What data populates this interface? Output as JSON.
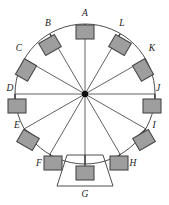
{
  "figure": {
    "type": "technical-diagram",
    "width": 169,
    "height": 205
  },
  "colors": {
    "background": "#ffffff",
    "stroke": "#3a3a3a",
    "block_fill": "#9e9e9e",
    "block_stroke": "#4a4a4a",
    "label": "#1a1a1a",
    "hub": "#111111"
  },
  "geometry": {
    "center_x": 85,
    "center_y": 94,
    "radius": 70,
    "hub_radius": 3
  },
  "circle": {
    "name": "outer-circle",
    "cx": 85,
    "cy": 94,
    "r": 70
  },
  "hub": {
    "name": "center-hub",
    "cx": 85,
    "cy": 94,
    "r": 3.2
  },
  "trapezoid": {
    "name": "base-trapezoid",
    "points": "67,155 103,155 113,186 57,186"
  },
  "nodes": [
    {
      "id": "A",
      "label": "A",
      "angle_deg": 90,
      "rim_x": 85,
      "rim_y": 24,
      "box_x": 76,
      "box_y": 25,
      "box_w": 18,
      "box_h": 14,
      "box_rot": 0,
      "label_x": 85,
      "label_y": 16,
      "stem": "85,24 85,38"
    },
    {
      "id": "B",
      "label": "B",
      "angle_deg": 120,
      "rim_x": 50,
      "rim_y": 34,
      "box_x": 41,
      "box_y": 38,
      "box_w": 18,
      "box_h": 14,
      "box_rot": -30,
      "label_x": 48,
      "label_y": 26,
      "stem": "50,34 57,47"
    },
    {
      "id": "C",
      "label": "C",
      "angle_deg": 150,
      "rim_x": 24,
      "rim_y": 59,
      "box_x": 17,
      "box_y": 63,
      "box_w": 18,
      "box_h": 14,
      "box_rot": -60,
      "label_x": 19,
      "label_y": 51,
      "stem": "24,59 36,66"
    },
    {
      "id": "D",
      "label": "D",
      "angle_deg": 180,
      "rim_x": 15,
      "rim_y": 94,
      "box_x": 8,
      "box_y": 99,
      "box_w": 18,
      "box_h": 14,
      "box_rot": 0,
      "label_x": 10,
      "label_y": 91,
      "stem": "15,94 15,106"
    },
    {
      "id": "E",
      "label": "E",
      "angle_deg": 210,
      "rim_x": 24,
      "rim_y": 129,
      "box_x": 19,
      "box_y": 133,
      "box_w": 18,
      "box_h": 14,
      "box_rot": 30,
      "label_x": 17,
      "label_y": 128,
      "stem": "24,129 34,136"
    },
    {
      "id": "F",
      "label": "F",
      "angle_deg": 240,
      "rim_x": 50,
      "rim_y": 154,
      "box_x": 44,
      "box_y": 156,
      "box_w": 18,
      "box_h": 14,
      "box_rot": 0,
      "label_x": 39,
      "label_y": 166,
      "stem": "50,154 53,163"
    },
    {
      "id": "G",
      "label": "G",
      "angle_deg": 270,
      "rim_x": 85,
      "rim_y": 164,
      "box_x": 76,
      "box_y": 166,
      "box_w": 18,
      "box_h": 14,
      "box_rot": 0,
      "label_x": 85,
      "label_y": 197,
      "stem": "85,155 85,166"
    },
    {
      "id": "H",
      "label": "H",
      "angle_deg": 300,
      "rim_x": 120,
      "rim_y": 154,
      "box_x": 110,
      "box_y": 156,
      "box_w": 18,
      "box_h": 14,
      "box_rot": 0,
      "label_x": 133,
      "label_y": 166,
      "stem": "120,154 117,163"
    },
    {
      "id": "I",
      "label": "I",
      "angle_deg": 330,
      "rim_x": 146,
      "rim_y": 129,
      "box_x": 135,
      "box_y": 133,
      "box_w": 18,
      "box_h": 14,
      "box_rot": -30,
      "label_x": 154,
      "label_y": 128,
      "stem": "146,129 138,136"
    },
    {
      "id": "J",
      "label": "J",
      "angle_deg": 0,
      "rim_x": 155,
      "rim_y": 94,
      "box_x": 143,
      "box_y": 99,
      "box_w": 18,
      "box_h": 14,
      "box_rot": 0,
      "label_x": 158,
      "label_y": 91,
      "stem": "155,94 155,106"
    },
    {
      "id": "K",
      "label": "K",
      "angle_deg": 30,
      "rim_x": 146,
      "rim_y": 59,
      "box_x": 134,
      "box_y": 63,
      "box_w": 18,
      "box_h": 14,
      "box_rot": 60,
      "label_x": 152,
      "label_y": 51,
      "stem": "146,59 136,66"
    },
    {
      "id": "L",
      "label": "L",
      "angle_deg": 60,
      "rim_x": 120,
      "rim_y": 34,
      "box_x": 111,
      "box_y": 38,
      "box_w": 18,
      "box_h": 14,
      "box_rot": 30,
      "label_x": 122,
      "label_y": 26,
      "stem": "120,34 114,47"
    }
  ],
  "spokes": [
    {
      "name": "spoke-A",
      "to": "A",
      "x2": 85,
      "y2": 24
    },
    {
      "name": "spoke-B",
      "to": "B",
      "x2": 50,
      "y2": 34
    },
    {
      "name": "spoke-C",
      "to": "C",
      "x2": 24,
      "y2": 59
    },
    {
      "name": "spoke-D",
      "to": "D",
      "x2": 15,
      "y2": 94
    },
    {
      "name": "spoke-E",
      "to": "E",
      "x2": 24,
      "y2": 129
    },
    {
      "name": "spoke-F",
      "to": "F",
      "x2": 50,
      "y2": 154
    },
    {
      "name": "spoke-G",
      "to": "G",
      "x2": 85,
      "y2": 164
    },
    {
      "name": "spoke-H",
      "to": "H",
      "x2": 120,
      "y2": 154
    },
    {
      "name": "spoke-I",
      "to": "I",
      "x2": 146,
      "y2": 129
    },
    {
      "name": "spoke-J",
      "to": "J",
      "x2": 155,
      "y2": 94
    },
    {
      "name": "spoke-K",
      "to": "K",
      "x2": 146,
      "y2": 59
    },
    {
      "name": "spoke-L",
      "to": "L",
      "x2": 120,
      "y2": 34
    }
  ]
}
